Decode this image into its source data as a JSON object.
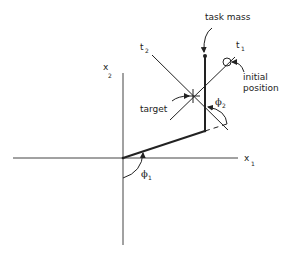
{
  "diagram": {
    "type": "two-link arm kinematics diagram",
    "axes": {
      "x1": {
        "label": "x",
        "subscript": "1"
      },
      "x2": {
        "label": "x",
        "subscript": "2"
      }
    },
    "lines": {
      "t1": {
        "label": "t",
        "subscript": "1"
      },
      "t2": {
        "label": "t",
        "subscript": "2"
      }
    },
    "angles": {
      "phi1": {
        "label": "ϕ",
        "subscript": "1"
      },
      "phi2": {
        "label": "ϕ",
        "subscript": "2"
      }
    },
    "annotations": {
      "task_mass": "task mass",
      "target": "target",
      "initial_line1": "initial",
      "initial_line2": "position"
    },
    "colors": {
      "stroke": "#222222",
      "background": "#ffffff"
    }
  }
}
